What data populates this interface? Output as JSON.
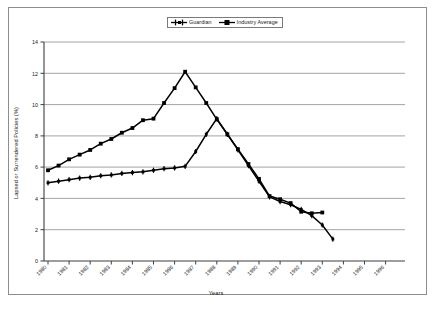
{
  "chart_data": {
    "type": "line",
    "title": "",
    "xlabel": "Years",
    "ylabel": "Lapsed or Surrendered Policies (%)",
    "ylim": [
      0,
      14
    ],
    "ytick_step": 2,
    "yticks": [
      0,
      2,
      4,
      6,
      8,
      10,
      12,
      14
    ],
    "grid": "horizontal",
    "legend_position": "top-center",
    "categories": [
      "1980",
      "1981",
      "1982",
      "1983",
      "1984",
      "1985",
      "1986",
      "1987",
      "1988",
      "1989",
      "1990",
      "1991",
      "1992",
      "1993",
      "1994",
      "1995",
      "1996"
    ],
    "x": [
      "1980",
      "1981",
      "1982",
      "1983",
      "1984",
      "1985",
      "1986",
      "1987",
      "1988",
      "1989",
      "1990",
      "1991",
      "1992",
      "1993",
      "1994",
      "1995",
      "1996"
    ],
    "series": [
      {
        "name": "Guardian",
        "marker": "plus",
        "color": "#000000",
        "values": [
          5.0,
          5.15,
          5.25,
          5.35,
          5.45,
          5.55,
          5.65,
          5.75,
          5.85,
          5.95,
          6.05,
          7.0,
          8.1,
          9.1,
          7.2,
          6.1,
          5.1
        ]
      },
      {
        "name": "Industry Average",
        "marker": "square",
        "color": "#000000",
        "values": [
          5.8,
          6.15,
          6.5,
          6.85,
          7.2,
          7.55,
          7.9,
          8.25,
          8.6,
          9.0,
          9.1,
          10.1,
          11.05,
          12.1,
          11.1,
          10.1,
          9.05
        ]
      }
    ],
    "series_detail": {
      "note": "Chart plots half-year steps; markers appear at each semi-annual interval between the labelled years.",
      "guardian_points": [
        5.0,
        5.1,
        5.2,
        5.3,
        5.35,
        5.45,
        5.5,
        5.6,
        5.65,
        5.7,
        5.8,
        5.9,
        5.95,
        6.05,
        7.0,
        8.1,
        9.1,
        8.1,
        7.1,
        6.1,
        5.1,
        4.1,
        3.8,
        3.6,
        3.3,
        2.9,
        2.3,
        1.4
      ],
      "industry_points": [
        5.8,
        6.1,
        6.5,
        6.8,
        7.1,
        7.5,
        7.8,
        8.2,
        8.5,
        9.0,
        9.1,
        10.1,
        11.05,
        12.1,
        11.1,
        10.1,
        9.05,
        8.1,
        7.15,
        6.2,
        5.25,
        4.15,
        3.95,
        3.7,
        3.15,
        3.05,
        3.1
      ]
    }
  },
  "legend": {
    "entries": [
      {
        "label": "Guardian",
        "marker": "plus-line-marker"
      },
      {
        "label": "Industry Average",
        "marker": "square-line-marker"
      }
    ]
  },
  "axes": {
    "y_title": "Lapsed or Surrendered Policies (%)",
    "x_title": "Years",
    "y_ticks": [
      "0",
      "2",
      "4",
      "6",
      "8",
      "10",
      "12",
      "14"
    ],
    "x_ticks": [
      "1980",
      "1981",
      "1982",
      "1983",
      "1984",
      "1985",
      "1986",
      "1987",
      "1988",
      "1989",
      "1990",
      "1991",
      "1992",
      "1993",
      "1994",
      "1995",
      "1996"
    ]
  },
  "colors": {
    "frame": "#8d8d8d",
    "gridline": "#9a9a9a",
    "axis": "#4a4a4a",
    "series": "#000000",
    "background": "#ffffff"
  },
  "caption": {
    "partial_text": ""
  }
}
